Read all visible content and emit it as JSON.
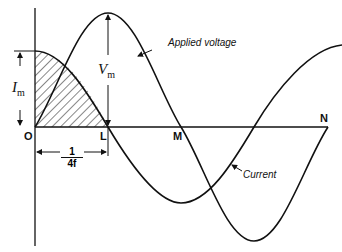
{
  "diagram": {
    "points": {
      "O": "O",
      "L": "L",
      "M": "M",
      "N": "N"
    },
    "curves": {
      "voltage_label": "Applied voltage",
      "current_label": "Current"
    },
    "dimensions": {
      "current_amplitude": "I",
      "current_amplitude_sub": "m",
      "voltage_amplitude": "V",
      "voltage_amplitude_sub": "m",
      "quarter_period_num": "1",
      "quarter_period_den": "4f"
    },
    "colors": {
      "ink": "#111111",
      "background": "#ffffff"
    }
  }
}
